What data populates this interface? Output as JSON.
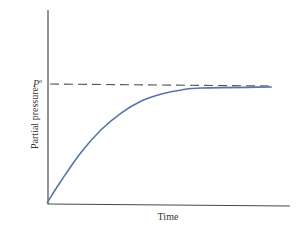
{
  "chart_data": {
    "type": "line",
    "title": "",
    "xlabel": "Time",
    "ylabel": "Partial pressure",
    "grid": false,
    "legend": null,
    "annotations": [
      {
        "type": "hline",
        "style": "dashed",
        "label": "P°",
        "label_base": "P",
        "label_sup": "o",
        "y": 1.0
      }
    ],
    "xlim": [
      0,
      1
    ],
    "ylim": [
      0,
      1.5
    ],
    "series": [
      {
        "name": "partial pressure vs time",
        "x": [
          0,
          0.054,
          0.136,
          0.218,
          0.3,
          0.382,
          0.464,
          0.545,
          0.627,
          0.91
        ],
        "y": [
          0,
          0.176,
          0.42,
          0.613,
          0.756,
          0.857,
          0.916,
          0.95,
          0.966,
          0.975
        ]
      }
    ],
    "colors": {
      "curve": "#5a73a6",
      "axes": "#4a4a4a",
      "dashed": "#555555"
    }
  }
}
